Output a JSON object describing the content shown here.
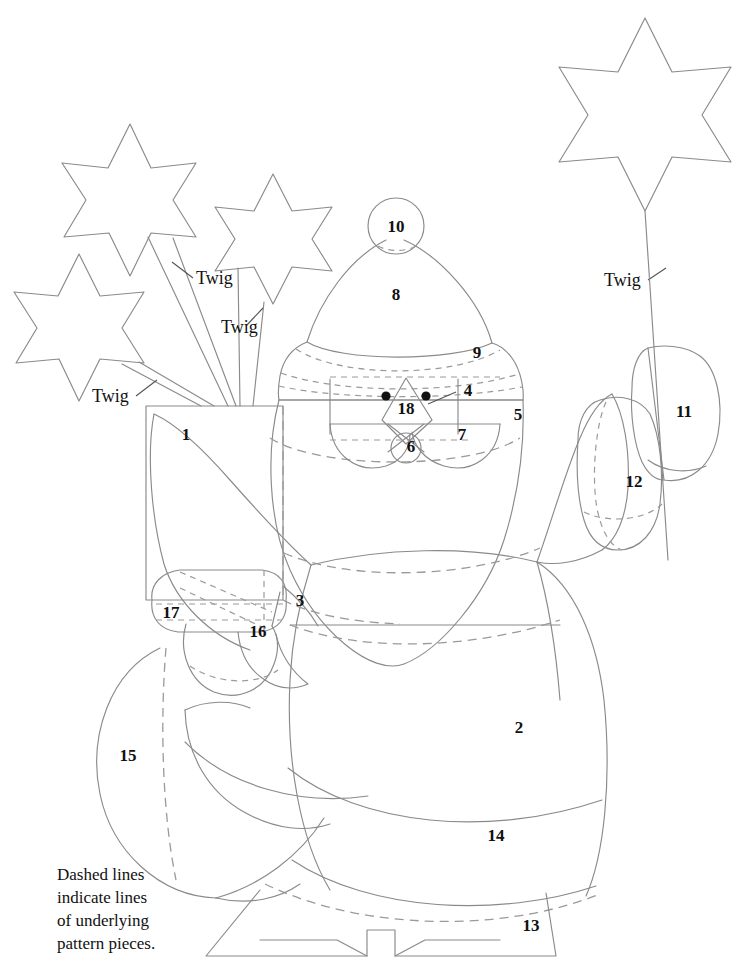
{
  "document": {
    "title": "Santa with Stars Pattern Layout",
    "kind": "sewing-pattern-diagram",
    "width": 744,
    "height": 972,
    "background_color": "#ffffff",
    "line_color": "#8a8a8a",
    "dash_color": "#9a9a9a",
    "label_color": "#111111"
  },
  "caption": {
    "lines": [
      "Dashed lines",
      "indicate lines",
      "of underlying",
      "pattern pieces."
    ]
  },
  "twig_labels": [
    {
      "id": "twig-upper-left",
      "text": "Twig",
      "x": 196,
      "y": 284
    },
    {
      "id": "twig-mid-left",
      "text": "Twig",
      "x": 221,
      "y": 333
    },
    {
      "id": "twig-lower-left",
      "text": "Twig",
      "x": 92,
      "y": 402
    },
    {
      "id": "twig-right",
      "text": "Twig",
      "x": 604,
      "y": 286
    }
  ],
  "piece_labels": [
    {
      "number": "1",
      "x": 186,
      "y": 440,
      "piece": "basket"
    },
    {
      "number": "2",
      "x": 519,
      "y": 733,
      "piece": "robe-body"
    },
    {
      "number": "3",
      "x": 300,
      "y": 606,
      "piece": "left-arm"
    },
    {
      "number": "4",
      "x": 468,
      "y": 396,
      "piece": "face"
    },
    {
      "number": "5",
      "x": 518,
      "y": 420,
      "piece": "beard"
    },
    {
      "number": "6",
      "x": 411,
      "y": 446,
      "piece": "mouth"
    },
    {
      "number": "7",
      "x": 462,
      "y": 434,
      "piece": "mustache"
    },
    {
      "number": "8",
      "x": 396,
      "y": 300,
      "piece": "hat-crown"
    },
    {
      "number": "9",
      "x": 477,
      "y": 352,
      "piece": "hat-brim"
    },
    {
      "number": "10",
      "x": 396,
      "y": 226,
      "piece": "pom-pom"
    },
    {
      "number": "11",
      "x": 684,
      "y": 411,
      "piece": "right-hand"
    },
    {
      "number": "12",
      "x": 634,
      "y": 481,
      "piece": "right-cuff"
    },
    {
      "number": "13",
      "x": 531,
      "y": 925,
      "piece": "base-stand"
    },
    {
      "number": "14",
      "x": 496,
      "y": 835,
      "piece": "robe-hem"
    },
    {
      "number": "15",
      "x": 128,
      "y": 755,
      "piece": "sack"
    },
    {
      "number": "16",
      "x": 258,
      "y": 631,
      "piece": "mitten"
    },
    {
      "number": "17",
      "x": 171,
      "y": 612,
      "piece": "left-cuff"
    },
    {
      "number": "18",
      "x": 406,
      "y": 408,
      "piece": "nose"
    }
  ],
  "features": {
    "eyes": [
      {
        "cx": 386,
        "cy": 396,
        "r": 4.6
      },
      {
        "cx": 426,
        "cy": 396,
        "r": 4.6
      }
    ],
    "stars": [
      {
        "id": "star-top-left",
        "cx": 128,
        "cy": 196,
        "r": 72,
        "points": 6
      },
      {
        "id": "star-mid",
        "cx": 272,
        "cy": 232,
        "r": 62,
        "points": 6
      },
      {
        "id": "star-bottom-left",
        "cx": 78,
        "cy": 318,
        "r": 66,
        "points": 6
      },
      {
        "id": "star-right",
        "cx": 645,
        "cy": 92,
        "r": 78,
        "points": 6
      }
    ]
  }
}
